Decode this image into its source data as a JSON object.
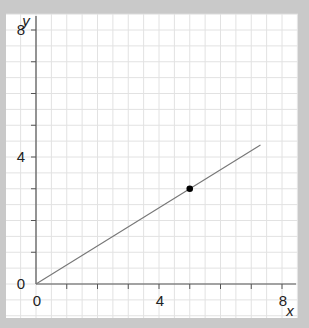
{
  "colors": {
    "frame": "#c9c9c9",
    "panel": "#ffffff",
    "grid": "#e2e2e2",
    "axis": "#555555",
    "line": "#777777",
    "point": "#000000",
    "text": "#222222"
  },
  "chart_data": {
    "type": "line",
    "title": "",
    "xlabel": "x",
    "ylabel": "y",
    "xlim": [
      0,
      8
    ],
    "ylim": [
      0,
      8
    ],
    "x_ticks": [
      0,
      4,
      8
    ],
    "y_ticks": [
      0,
      4,
      8
    ],
    "x_minor_step": 1,
    "y_minor_step": 1,
    "grid": true,
    "grid_step": 0.5,
    "legend": null,
    "series": [
      {
        "name": "line through origin",
        "type": "line",
        "x": [
          0,
          7.3
        ],
        "y": [
          0,
          4.38
        ]
      },
      {
        "name": "marked point",
        "type": "scatter",
        "x": [
          5
        ],
        "y": [
          3
        ]
      }
    ]
  }
}
